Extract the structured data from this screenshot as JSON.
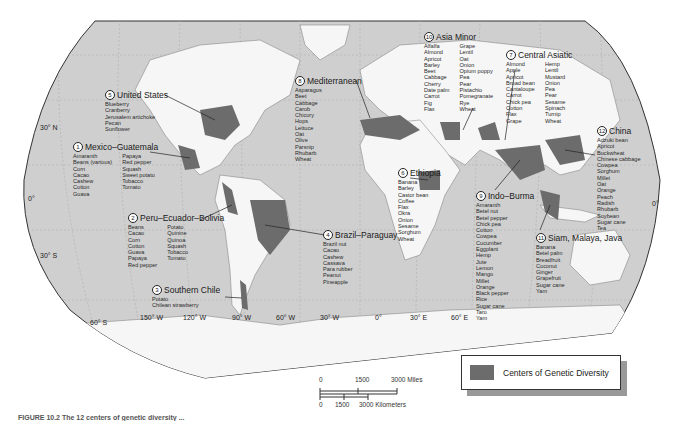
{
  "legend": {
    "label": "Centers of Genetic Diversity",
    "swatch_color": "#6c6c6c"
  },
  "scale": {
    "miles": {
      "ticks": [
        "0",
        "1500",
        "3000 Miles"
      ]
    },
    "kilometers": {
      "ticks": [
        "0",
        "1500",
        "3000 Kilometers"
      ]
    }
  },
  "latitudes": [
    "30° N",
    "0°",
    "30° S",
    "60° S",
    "0°"
  ],
  "longitudes": [
    "150° W",
    "120° W",
    "90° W",
    "60° W",
    "30° W",
    "0°",
    "30° E",
    "60° E"
  ],
  "caption": "FIGURE 10.2 The 12 centers of genetic diversity ...",
  "centers": [
    {
      "num": "1",
      "name": "Mexico–Guatemala",
      "col1": [
        "Amaranth",
        "Beans (various)",
        "Corn",
        "Cacao",
        "Cashew",
        "Cotton",
        "Guava"
      ],
      "col2": [
        "Papaya",
        "Red pepper",
        "Squash",
        "Sweet potato",
        "Tobacco",
        "Tomato"
      ]
    },
    {
      "num": "2",
      "name": "Peru–Ecuador–Bolivia",
      "col1": [
        "Beans",
        "Cacao",
        "Corn",
        "Cotton",
        "Guava",
        "Papaya",
        "Red pepper"
      ],
      "col2": [
        "Potato",
        "Quinine",
        "Quinoa",
        "Squash",
        "Tobacco",
        "Tomato"
      ]
    },
    {
      "num": "3",
      "name": "Southern Chile",
      "col1": [
        "Potato",
        "Chilean strawberry"
      ],
      "col2": []
    },
    {
      "num": "4",
      "name": "Brazil–Paraguay",
      "col1": [
        "Brazil nut",
        "Cacao",
        "Cashew",
        "Cassava",
        "Para rubber",
        "Peanut",
        "Pineapple"
      ],
      "col2": []
    },
    {
      "num": "5",
      "name": "United States",
      "col1": [
        "Blueberry",
        "Cranberry",
        "Jerusalem artichoke",
        "Pecan",
        "Sunflower"
      ],
      "col2": []
    },
    {
      "num": "6",
      "name": "Ethiopia",
      "col1": [
        "Banana",
        "Barley",
        "Castor bean",
        "Coffee",
        "Flax",
        "Okra",
        "Onion",
        "Sesame",
        "Sorghum",
        "Wheat"
      ],
      "col2": []
    },
    {
      "num": "7",
      "name": "Central Asiatic",
      "col1": [
        "Almond",
        "Apple",
        "Apricot",
        "Broad bean",
        "Cantaloupe",
        "Carrot",
        "Chick pea",
        "Cotton",
        "Flax",
        "Grape"
      ],
      "col2": [
        "Hemp",
        "Lentil",
        "Mustard",
        "Onion",
        "Pea",
        "Pear",
        "Sesame",
        "Spinach",
        "Turnip",
        "Wheat"
      ]
    },
    {
      "num": "8",
      "name": "Mediterranean",
      "col1": [
        "Asparagus",
        "Beet",
        "Cabbage",
        "Carob",
        "Chicory",
        "Hops",
        "Lettuce",
        "Oat",
        "Olive",
        "Parsnip",
        "Rhubarb",
        "Wheat"
      ],
      "col2": []
    },
    {
      "num": "9",
      "name": "Indo–Burma",
      "col1": [
        "Amaranth",
        "Betel nut",
        "Betel pepper",
        "Chick pea",
        "Cotton",
        "Cowpea",
        "Cucumber",
        "Eggplant",
        "Hemp",
        "Jute",
        "Lemon",
        "Mango",
        "Millet",
        "Orange",
        "Black pepper",
        "Rice",
        "Sugar cane",
        "Taro",
        "Yam"
      ],
      "col2": []
    },
    {
      "num": "10",
      "name": "Asia Minor",
      "col1": [
        "Alfalfa",
        "Almond",
        "Apricot",
        "Barley",
        "Beet",
        "Cabbage",
        "Cherry",
        "Date palm",
        "Carrot",
        "Fig",
        "Flax"
      ],
      "col2": [
        "Grape",
        "Lentil",
        "Oat",
        "Onion",
        "Opium poppy",
        "Pea",
        "Pear",
        "Pistachio",
        "Pomegranate",
        "Rye",
        "Wheat"
      ]
    },
    {
      "num": "11",
      "name": "Siam, Malaya, Java",
      "col1": [
        "Banana",
        "Betel palm",
        "Breadfruit",
        "Coconut",
        "Ginger",
        "Grapefruit",
        "Sugar cane",
        "Yam"
      ],
      "col2": []
    },
    {
      "num": "12",
      "name": "China",
      "col1": [
        "Adzuki bean",
        "Apricot",
        "Buckwheat",
        "Chinese cabbage",
        "Cowpea",
        "Sorghum",
        "Millet",
        "Oat",
        "Orange",
        "Peach",
        "Radish",
        "Rhubarb",
        "Soybean",
        "Sugar cane",
        "Tea"
      ],
      "col2": []
    }
  ]
}
